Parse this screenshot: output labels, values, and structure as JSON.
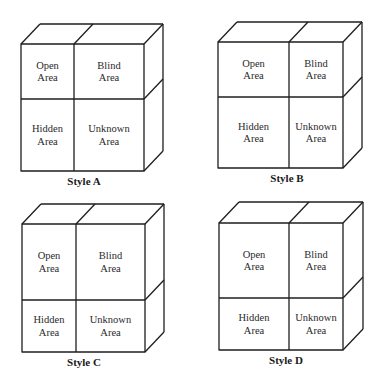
{
  "figure": {
    "background": "#ffffff",
    "line_color": "#1e1e1e",
    "text_color": "#2a2a2a",
    "cells": {
      "open": [
        "Open",
        "Area"
      ],
      "blind": [
        "Blind",
        "Area"
      ],
      "hidden": [
        "Hidden",
        "Area"
      ],
      "unknown": [
        "Unknown",
        "Area"
      ]
    },
    "windows": [
      {
        "label": "Style A",
        "front": {
          "x1": 21,
          "y1": 44,
          "x2": 144,
          "y2": 171,
          "vx": 74,
          "hy": 99
        },
        "depth": {
          "dx": 19,
          "dy": -20
        },
        "label_pos": {
          "x": 84,
          "y": 185
        }
      },
      {
        "label": "Style B",
        "front": {
          "x1": 218,
          "y1": 42,
          "x2": 343,
          "y2": 168,
          "vx": 289,
          "hy": 97
        },
        "depth": {
          "dx": 19,
          "dy": -20
        },
        "label_pos": {
          "x": 287,
          "y": 182
        }
      },
      {
        "label": "Style C",
        "front": {
          "x1": 22,
          "y1": 224,
          "x2": 145,
          "y2": 352,
          "vx": 76,
          "hy": 300
        },
        "depth": {
          "dx": 19,
          "dy": -20
        },
        "label_pos": {
          "x": 84,
          "y": 366
        }
      },
      {
        "label": "Style D",
        "front": {
          "x1": 219,
          "y1": 223,
          "x2": 343,
          "y2": 350,
          "vx": 289,
          "hy": 298
        },
        "depth": {
          "dx": 20,
          "dy": -21
        },
        "label_pos": {
          "x": 286,
          "y": 364
        }
      }
    ]
  }
}
